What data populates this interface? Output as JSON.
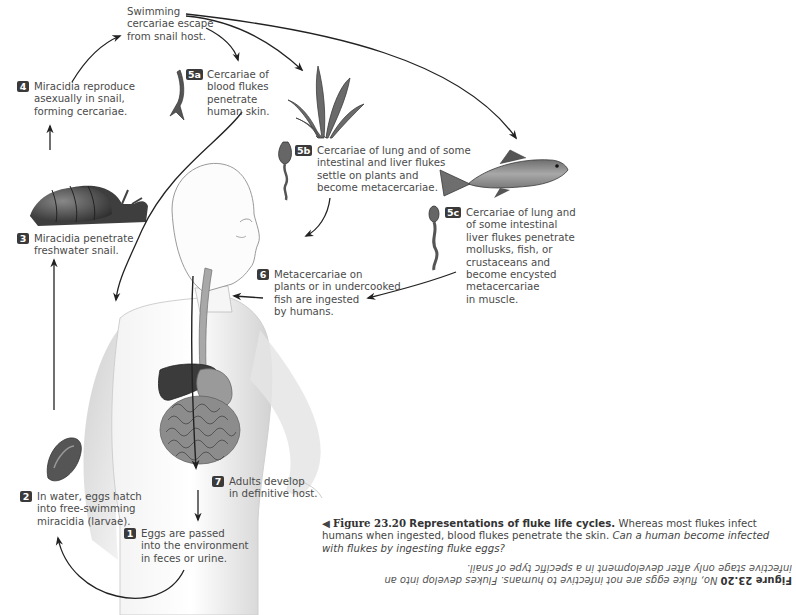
{
  "figure": {
    "number": "Figure 23.20",
    "title": "Representations of fluke life cycles.",
    "caption_text": "Whereas most flukes infect humans when ingested, blood flukes penetrate the skin.",
    "question": "Can a human become infected with flukes by ingesting fluke eggs?",
    "answer_label": "Figure 23.20",
    "answer_text": "No, fluke eggs are not infective to humans. Flukes develop into an infective stage only after development in a specific type of snail.",
    "arrow_icon": "◀"
  },
  "steps": {
    "escape": {
      "lines": [
        "Swimming",
        "cercariae escape",
        "from snail host."
      ]
    },
    "s1": {
      "badge": "1",
      "lines": [
        "Eggs are passed",
        "into the environment",
        "in feces or urine."
      ]
    },
    "s2": {
      "badge": "2",
      "lines": [
        "In water, eggs hatch",
        "into free-swimming",
        "miracidia (larvae)."
      ]
    },
    "s3": {
      "badge": "3",
      "lines": [
        "Miracidia penetrate",
        "freshwater snail."
      ]
    },
    "s4": {
      "badge": "4",
      "lines": [
        "Miracidia reproduce",
        "asexually in snail,",
        "forming cercariae."
      ]
    },
    "s5a": {
      "badge": "5a",
      "lines": [
        "Cercariae of",
        "blood flukes",
        "penetrate",
        "human skin."
      ]
    },
    "s5b": {
      "badge": "5b",
      "lines": [
        "Cercariae of lung and of some",
        "intestinal and liver flukes",
        "settle on plants and",
        "become metacercariae."
      ]
    },
    "s5c": {
      "badge": "5c",
      "lines": [
        "Cercariae of lung and",
        "of some intestinal",
        "liver flukes penetrate",
        "mollusks, fish, or",
        "crustaceans and",
        "become encysted",
        "metacercariae",
        "in muscle."
      ]
    },
    "s6": {
      "badge": "6",
      "lines": [
        "Metacercariae on",
        "plants or in undercooked",
        "fish are ingested",
        "by humans."
      ]
    },
    "s7": {
      "badge": "7",
      "lines": [
        "Adults develop",
        "in definitive host."
      ]
    }
  },
  "colors": {
    "badge_bg": "#3a3a3a",
    "text": "#4a4a4a",
    "arrow": "#222222",
    "liver": "#3b3b3b",
    "body_shade": "#cfcfcf"
  }
}
